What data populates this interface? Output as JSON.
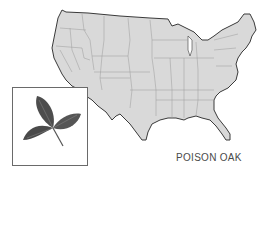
{
  "caption": "POISON OAK",
  "colors": {
    "land": "#d9d9d9",
    "outline": "#3a3a3a",
    "state_border": "#9a9a9a",
    "leaf": "#4d4d4d",
    "inset_border": "#6a6a6a"
  },
  "map": {
    "region": "United States (contiguous)",
    "inset": "poison oak leaf illustration"
  }
}
